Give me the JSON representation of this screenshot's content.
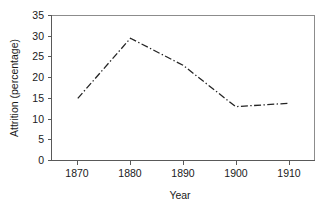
{
  "chart_data": {
    "type": "line",
    "title": "",
    "xlabel": "Year",
    "ylabel": "Attrition (percentage)",
    "xlim": [
      1865,
      1915
    ],
    "ylim": [
      0,
      35
    ],
    "xticks": [
      1870,
      1880,
      1890,
      1900,
      1910
    ],
    "yticks": [
      0,
      5,
      10,
      15,
      20,
      25,
      30,
      35
    ],
    "grid": false,
    "legend": null,
    "x": [
      1870,
      1880,
      1890,
      1900,
      1910
    ],
    "values": [
      15,
      29.5,
      23,
      13,
      13.8
    ],
    "series": [
      {
        "name": "Attrition",
        "x": [
          1870,
          1880,
          1890,
          1900,
          1910
        ],
        "values": [
          15,
          29.5,
          23,
          13,
          13.8
        ],
        "style": "dash-dot",
        "color": "#242424"
      }
    ]
  },
  "axes": {
    "y_title": "Attrition (percentage)",
    "x_title": "Year",
    "y_tick_labels": [
      "0",
      "5",
      "10",
      "15",
      "20",
      "25",
      "30",
      "35"
    ],
    "x_tick_labels": [
      "1870",
      "1880",
      "1890",
      "1900",
      "1910"
    ]
  },
  "colors": {
    "line": "#242424",
    "axis": "#595959",
    "frame": "#8c8c8c",
    "text": "#1a1a1a",
    "background": "#ffffff"
  }
}
